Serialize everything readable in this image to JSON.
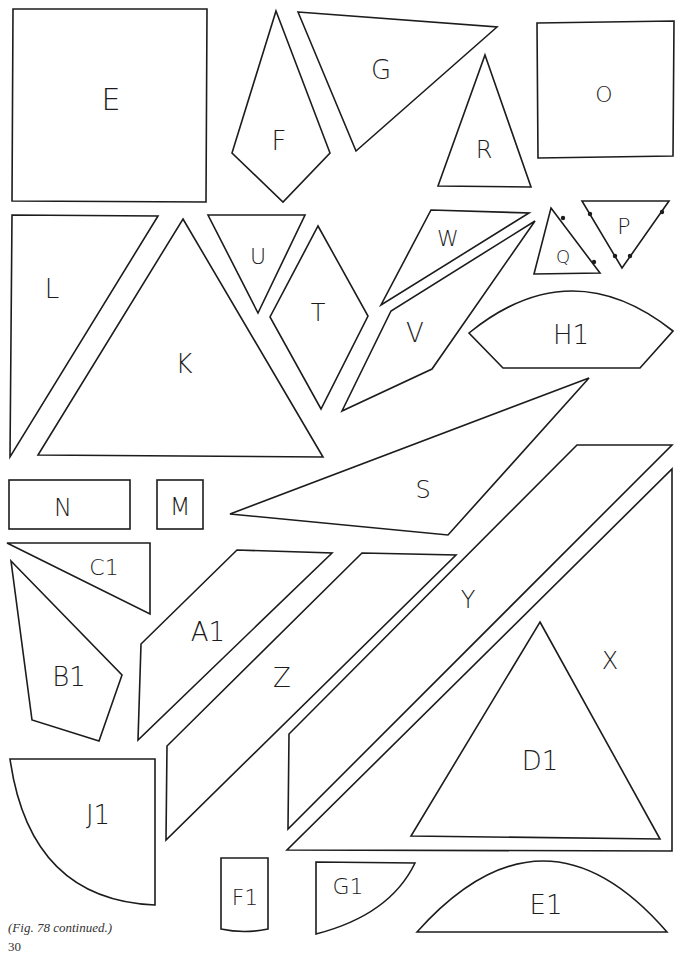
{
  "figure": {
    "caption": "(Fig. 78 continued.)",
    "page_number": "30",
    "stroke_color": "#1c1c1c",
    "background": "#ffffff"
  },
  "pieces": [
    {
      "label": "E",
      "shape": "square",
      "lx": 111,
      "ly": 99,
      "size": 30
    },
    {
      "label": "F",
      "shape": "kite",
      "lx": 279,
      "ly": 141,
      "size": 26
    },
    {
      "label": "G",
      "shape": "triangle",
      "lx": 381,
      "ly": 70,
      "size": 26
    },
    {
      "label": "R",
      "shape": "triangle",
      "lx": 484,
      "ly": 150,
      "size": 24
    },
    {
      "label": "O",
      "shape": "square",
      "lx": 604,
      "ly": 94,
      "size": 22
    },
    {
      "label": "L",
      "shape": "triangle",
      "lx": 52,
      "ly": 289,
      "size": 26
    },
    {
      "label": "K",
      "shape": "triangle",
      "lx": 184,
      "ly": 364,
      "size": 26
    },
    {
      "label": "U",
      "shape": "triangle",
      "lx": 258,
      "ly": 256,
      "size": 22
    },
    {
      "label": "T",
      "shape": "rhombus",
      "lx": 318,
      "ly": 313,
      "size": 24
    },
    {
      "label": "W",
      "shape": "triangle",
      "lx": 448,
      "ly": 238,
      "size": 22
    },
    {
      "label": "V",
      "shape": "quadrilateral",
      "lx": 415,
      "ly": 333,
      "size": 26
    },
    {
      "label": "Q",
      "shape": "triangle",
      "lx": 563,
      "ly": 256,
      "size": 18
    },
    {
      "label": "P",
      "shape": "triangle",
      "lx": 624,
      "ly": 226,
      "size": 22
    },
    {
      "label": "H1",
      "shape": "arched-hexagon",
      "lx": 571,
      "ly": 335,
      "size": 26
    },
    {
      "label": "S",
      "shape": "quadrilateral",
      "lx": 423,
      "ly": 490,
      "size": 24
    },
    {
      "label": "N",
      "shape": "rectangle",
      "lx": 63,
      "ly": 508,
      "size": 24
    },
    {
      "label": "M",
      "shape": "square",
      "lx": 180,
      "ly": 507,
      "size": 24
    },
    {
      "label": "C1",
      "shape": "triangle",
      "lx": 104,
      "ly": 567,
      "size": 22
    },
    {
      "label": "B1",
      "shape": "quadrilateral",
      "lx": 69,
      "ly": 677,
      "size": 26
    },
    {
      "label": "A1",
      "shape": "parallelogram",
      "lx": 208,
      "ly": 632,
      "size": 26
    },
    {
      "label": "Z",
      "shape": "parallelogram",
      "lx": 282,
      "ly": 678,
      "size": 26
    },
    {
      "label": "Y",
      "shape": "parallelogram",
      "lx": 468,
      "ly": 600,
      "size": 24
    },
    {
      "label": "X",
      "shape": "triangle",
      "lx": 610,
      "ly": 661,
      "size": 24
    },
    {
      "label": "D1",
      "shape": "triangle",
      "lx": 540,
      "ly": 761,
      "size": 26
    },
    {
      "label": "J1",
      "shape": "quarter-circle",
      "lx": 98,
      "ly": 815,
      "size": 26
    },
    {
      "label": "F1",
      "shape": "rectangle",
      "lx": 245,
      "ly": 897,
      "size": 22
    },
    {
      "label": "G1",
      "shape": "sector",
      "lx": 348,
      "ly": 886,
      "size": 22
    },
    {
      "label": "E1",
      "shape": "segment",
      "lx": 546,
      "ly": 905,
      "size": 26
    }
  ]
}
